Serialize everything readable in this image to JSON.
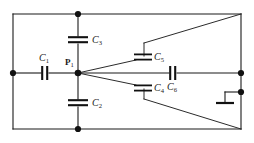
{
  "figure": {
    "type": "circuit-schematic",
    "title": "",
    "background_color": "#ffffff",
    "wire_color": "#1a1a1a",
    "width": 254,
    "height": 143
  },
  "nodes": [
    {
      "id": "P1",
      "label": "P",
      "subscript": "1",
      "name": "node-p1"
    },
    {
      "id": "left",
      "label": "",
      "subscript": "",
      "name": "node-left"
    },
    {
      "id": "top",
      "label": "",
      "subscript": "",
      "name": "node-top"
    },
    {
      "id": "bottom",
      "label": "",
      "subscript": "",
      "name": "node-bottom"
    },
    {
      "id": "right-mid",
      "label": "",
      "subscript": "",
      "name": "node-right-mid"
    },
    {
      "id": "right-gnd",
      "label": "",
      "subscript": "",
      "name": "node-right-ground"
    }
  ],
  "components": [
    {
      "id": "C1",
      "label": "C",
      "subscript": "1",
      "name": "capacitor-c1",
      "orientation": "vertical-plates",
      "position": "left-branch"
    },
    {
      "id": "C2",
      "label": "C",
      "subscript": "2",
      "name": "capacitor-c2",
      "orientation": "horizontal-plates",
      "position": "bottom-branch"
    },
    {
      "id": "C3",
      "label": "C",
      "subscript": "3",
      "name": "capacitor-c3",
      "orientation": "horizontal-plates",
      "position": "top-branch"
    },
    {
      "id": "C4",
      "label": "C",
      "subscript": "4",
      "name": "capacitor-c4",
      "orientation": "horizontal-plates",
      "position": "lower-diagonal-branch"
    },
    {
      "id": "C5",
      "label": "C",
      "subscript": "5",
      "name": "capacitor-c5",
      "orientation": "horizontal-plates",
      "position": "upper-diagonal-branch"
    },
    {
      "id": "C6",
      "label": "C",
      "subscript": "6",
      "name": "capacitor-c6",
      "orientation": "vertical-plates",
      "position": "middle-branch"
    },
    {
      "id": "GND",
      "label": "",
      "subscript": "",
      "name": "ground-symbol",
      "orientation": "",
      "position": "right-side"
    }
  ],
  "labels": {
    "c1": "C",
    "c1_sub": "1",
    "c2": "C",
    "c2_sub": "2",
    "c3": "C",
    "c3_sub": "3",
    "c4": "C",
    "c4_sub": "4",
    "c5": "C",
    "c5_sub": "5",
    "c6": "C",
    "c6_sub": "6",
    "p1": "P",
    "p1_sub": "1"
  }
}
